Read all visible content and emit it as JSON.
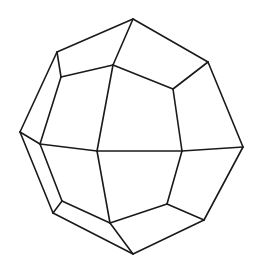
{
  "diagram": {
    "type": "polyhedron-wireframe",
    "stroke_color": "#1a1a1a",
    "background": "#ffffff",
    "vertices": {
      "top": [
        133,
        19
      ],
      "upper_left": [
        57,
        52
      ],
      "left": [
        20,
        132
      ],
      "lower_left": [
        53,
        213
      ],
      "bottom": [
        133,
        254
      ],
      "lower_right": [
        204,
        220
      ],
      "right": [
        243,
        147
      ],
      "upper_right": [
        208,
        62
      ],
      "inner_top": [
        113,
        65
      ],
      "inner_upper_left": [
        61,
        77
      ],
      "inner_left": [
        40,
        144
      ],
      "inner_lower_left": [
        62,
        201
      ],
      "inner_bottom": [
        110,
        223
      ],
      "inner_bottom_right": [
        167,
        204
      ],
      "center_right": [
        182,
        151
      ],
      "inner_right": [
        173,
        89
      ],
      "center_left": [
        97,
        151
      ]
    },
    "edges": [
      [
        "top",
        "upper_left"
      ],
      [
        "upper_left",
        "left"
      ],
      [
        "left",
        "lower_left"
      ],
      [
        "lower_left",
        "bottom"
      ],
      [
        "bottom",
        "lower_right"
      ],
      [
        "lower_right",
        "right"
      ],
      [
        "right",
        "upper_right"
      ],
      [
        "upper_right",
        "top"
      ],
      [
        "top",
        "inner_top"
      ],
      [
        "upper_left",
        "inner_upper_left"
      ],
      [
        "inner_upper_left",
        "inner_top"
      ],
      [
        "inner_top",
        "inner_right"
      ],
      [
        "inner_right",
        "upper_right"
      ],
      [
        "inner_right",
        "center_right"
      ],
      [
        "inner_upper_left",
        "inner_left"
      ],
      [
        "inner_left",
        "left"
      ],
      [
        "inner_left",
        "center_left"
      ],
      [
        "center_left",
        "inner_top"
      ],
      [
        "center_left",
        "center_right"
      ],
      [
        "center_right",
        "right"
      ],
      [
        "center_left",
        "inner_bottom"
      ],
      [
        "inner_left",
        "inner_lower_left"
      ],
      [
        "inner_lower_left",
        "lower_left"
      ],
      [
        "inner_lower_left",
        "inner_bottom"
      ],
      [
        "inner_bottom",
        "bottom"
      ],
      [
        "inner_bottom",
        "inner_bottom_right"
      ],
      [
        "inner_bottom_right",
        "center_right"
      ],
      [
        "inner_bottom_right",
        "lower_right"
      ]
    ]
  }
}
